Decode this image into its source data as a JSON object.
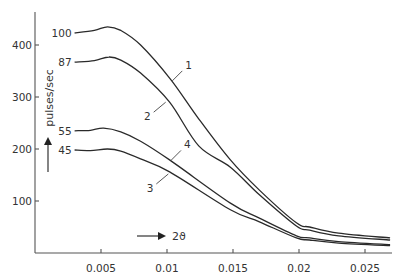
{
  "chart_data": {
    "type": "line",
    "title": "",
    "xlabel": "2ϑ",
    "ylabel": "pulses/sec",
    "xlim": [
      0,
      0.027
    ],
    "ylim": [
      0,
      470
    ],
    "grid": false,
    "legend": "none (curves numbered inline)",
    "x_ticks": [
      0.005,
      0.01,
      0.015,
      0.02,
      0.025
    ],
    "x_tick_labels": [
      "0.005",
      "0.01",
      "0.015",
      "0.02",
      "0.025"
    ],
    "y_ticks": [
      100,
      200,
      300,
      400
    ],
    "y_tick_labels": [
      "100",
      "200",
      "300",
      "400"
    ],
    "series": [
      {
        "name": "1",
        "start_label": "100",
        "x": [
          0.003,
          0.0045,
          0.0055,
          0.0065,
          0.008,
          0.0103,
          0.0124,
          0.0148,
          0.017,
          0.0198,
          0.0208,
          0.023,
          0.0269
        ],
        "y": [
          423,
          428,
          435,
          428,
          400,
          333,
          258,
          179,
          121,
          58,
          50,
          38,
          29
        ]
      },
      {
        "name": "2",
        "start_label": "87",
        "x": [
          0.003,
          0.0045,
          0.0056,
          0.0065,
          0.008,
          0.0102,
          0.0124,
          0.0148,
          0.017,
          0.0198,
          0.0208,
          0.023,
          0.0269
        ],
        "y": [
          367,
          370,
          377,
          371,
          346,
          290,
          206,
          165,
          112,
          52,
          44,
          33,
          25
        ]
      },
      {
        "name": "4",
        "start_label": "55",
        "x": [
          0.003,
          0.0042,
          0.0052,
          0.0065,
          0.008,
          0.0102,
          0.0148,
          0.017,
          0.0198,
          0.0208,
          0.023,
          0.0269
        ],
        "y": [
          235,
          236,
          240,
          233,
          215,
          179,
          96,
          67,
          33,
          29,
          22,
          16
        ]
      },
      {
        "name": "3",
        "start_label": "45",
        "x": [
          0.003,
          0.0042,
          0.0055,
          0.0065,
          0.008,
          0.0102,
          0.0148,
          0.017,
          0.0198,
          0.0208,
          0.023,
          0.0269
        ],
        "y": [
          198,
          197,
          200,
          196,
          181,
          156,
          83,
          60,
          29,
          25,
          19,
          14
        ]
      }
    ],
    "curve_labels": [
      {
        "text": "1",
        "x": 0.0104,
        "y": 331,
        "label_dx": 12,
        "label_dy": -12
      },
      {
        "text": "2",
        "x": 0.0099,
        "y": 290,
        "label_dx": -14,
        "label_dy": 12
      },
      {
        "text": "4",
        "x": 0.0103,
        "y": 178,
        "label_dx": 12,
        "label_dy": -12
      },
      {
        "text": "3",
        "x": 0.0101,
        "y": 152,
        "label_dx": -14,
        "label_dy": 12
      }
    ],
    "annotations": [
      {
        "text": "→ 2ϑ",
        "description": "x-direction arrow near x-axis"
      },
      {
        "text": "↑",
        "description": "upward arrow beside y label"
      }
    ]
  },
  "labels": {
    "ylabel": "pulses/sec",
    "xlabel": "2ϑ"
  }
}
